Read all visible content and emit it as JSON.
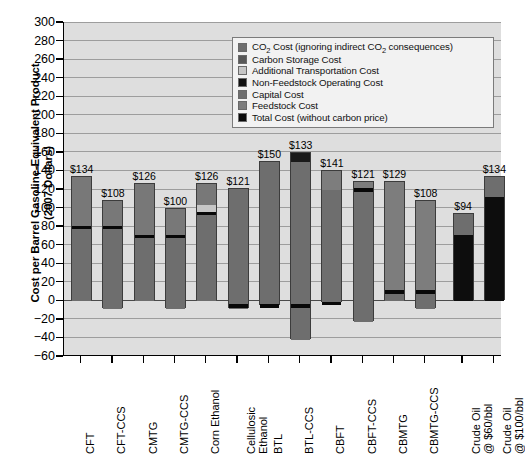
{
  "chart_data": {
    "type": "bar",
    "title": "",
    "xlabel": "",
    "ylabel": "Cost per Barrel Gasoline-Equivalent Product (2007 Dollars)",
    "ylabel_line1": "Cost per Barrel Gasoline-Equivalent Product",
    "ylabel_line2": "(2007 Dollars)",
    "ylim": [
      -60,
      300
    ],
    "ytick_step": 20,
    "ytick_labels": [
      "300",
      "280",
      "260",
      "240",
      "220",
      "200",
      "180",
      "160",
      "140",
      "120",
      "100",
      "80",
      "60",
      "40",
      "20",
      "0",
      "−20",
      "−40",
      "−60"
    ],
    "grid": true,
    "legend_position": "top-right",
    "stacked": true,
    "categories": [
      "CFT",
      "CFT-CCS",
      "CMTG",
      "CMTG-CCS",
      "Corn Ethanol",
      "Cellulosic Ethanol",
      "BTL",
      "BTL-CCS",
      "CBFT",
      "CBFT-CCS",
      "CBMTG",
      "CBMTG-CCS",
      "Crude Oil @ $60/bbl",
      "Crude Oil @ $100/bbl"
    ],
    "category_lines": [
      [
        "CFT"
      ],
      [
        "CFT-CCS"
      ],
      [
        "CMTG"
      ],
      [
        "CMTG-CCS"
      ],
      [
        "Corn Ethanol"
      ],
      [
        "Cellulosic",
        "Ethanol"
      ],
      [
        "BTL"
      ],
      [
        "BTL-CCS"
      ],
      [
        "CBFT"
      ],
      [
        "CBFT-CCS"
      ],
      [
        "CBMTG"
      ],
      [
        "CBMTG-CCS"
      ],
      [
        "Crude Oil",
        "@ $60/bbl"
      ],
      [
        "Crude Oil",
        "@ $100/bbl"
      ]
    ],
    "top_labels": [
      "$134",
      "$108",
      "$126",
      "$100",
      "$126",
      "$121",
      "$150",
      "$133",
      "$141",
      "$121",
      "$129",
      "$108",
      "$94",
      "$134"
    ],
    "values": [
      134,
      108,
      126,
      100,
      126,
      121,
      150,
      133,
      141,
      121,
      129,
      108,
      94,
      134
    ],
    "series": [
      {
        "name": "Feedstock Cost",
        "color": "#6e6e6e",
        "values": [
          134,
          108,
          126,
          100,
          126,
          121,
          150,
          133,
          141,
          121,
          129,
          108,
          0,
          0
        ]
      },
      {
        "name": "Capital Cost",
        "color": "#6e6e6e",
        "values": [
          0,
          0,
          0,
          0,
          0,
          0,
          0,
          0,
          0,
          0,
          0,
          0,
          0,
          0
        ]
      },
      {
        "name": "Non-Feedstock Operating Cost",
        "color": "#0d0d0d",
        "values": [
          0,
          0,
          0,
          0,
          0,
          0,
          0,
          0,
          0,
          0,
          0,
          0,
          94,
          134
        ]
      },
      {
        "name": "Additional Transportation Cost",
        "color": "#c6c6c6",
        "values": [
          0,
          0,
          0,
          0,
          8,
          0,
          0,
          0,
          0,
          0,
          0,
          0,
          0,
          0
        ]
      },
      {
        "name": "Carbon Storage Cost",
        "color": "#585858",
        "values": [
          0,
          0,
          0,
          0,
          0,
          0,
          0,
          0,
          0,
          0,
          0,
          0,
          0,
          0
        ]
      },
      {
        "name": "CO2 Cost (ignoring indirect CO2 consequences)",
        "color": "#6e6e6e",
        "values": [
          0,
          0,
          0,
          0,
          0,
          0,
          0,
          0,
          0,
          0,
          0,
          0,
          22,
          22
        ]
      }
    ],
    "total_cost_markers": [
      80,
      80,
      70,
      70,
      95,
      -5,
      -5,
      -5,
      -2,
      120,
      10,
      10,
      null,
      null
    ],
    "bars": [
      {
        "category": "CFT",
        "label": "$134",
        "top": 134,
        "bottom": 0,
        "total_cost_line": 80,
        "segments": [
          {
            "from": 0,
            "to": 80,
            "color": "#6e6e6e"
          },
          {
            "from": 80,
            "to": 134,
            "color": "#787878"
          }
        ]
      },
      {
        "category": "CFT-CCS",
        "label": "$108",
        "top": 108,
        "bottom": -8,
        "total_cost_line": 80,
        "segments": [
          {
            "from": -8,
            "to": 80,
            "color": "#6e6e6e"
          },
          {
            "from": 80,
            "to": 108,
            "color": "#787878"
          }
        ]
      },
      {
        "category": "CMTG",
        "label": "$126",
        "top": 126,
        "bottom": 0,
        "total_cost_line": 70,
        "segments": [
          {
            "from": 0,
            "to": 70,
            "color": "#6e6e6e"
          },
          {
            "from": 70,
            "to": 126,
            "color": "#787878"
          }
        ]
      },
      {
        "category": "CMTG-CCS",
        "label": "$100",
        "top": 100,
        "bottom": -8,
        "total_cost_line": 70,
        "segments": [
          {
            "from": -8,
            "to": 70,
            "color": "#6e6e6e"
          },
          {
            "from": 70,
            "to": 100,
            "color": "#787878"
          }
        ]
      },
      {
        "category": "Corn Ethanol",
        "label": "$126",
        "top": 126,
        "bottom": 0,
        "total_cost_line": 95,
        "segments": [
          {
            "from": 0,
            "to": 95,
            "color": "#6e6e6e"
          },
          {
            "from": 95,
            "to": 104,
            "color": "#c6c6c6"
          },
          {
            "from": 104,
            "to": 126,
            "color": "#787878"
          }
        ]
      },
      {
        "category": "Cellulosic Ethanol",
        "label": "$121",
        "top": 121,
        "bottom": -8,
        "total_cost_line": -5,
        "segments": [
          {
            "from": -8,
            "to": 121,
            "color": "#6e6e6e"
          }
        ]
      },
      {
        "category": "BTL",
        "label": "$150",
        "top": 150,
        "bottom": -5,
        "total_cost_line": -5,
        "segments": [
          {
            "from": -5,
            "to": 150,
            "color": "#6e6e6e"
          }
        ]
      },
      {
        "category": "BTL-CCS",
        "label": "$133",
        "top": 160,
        "bottom": -42,
        "total_cost_line": -5,
        "segments": [
          {
            "from": -42,
            "to": 150,
            "color": "#6e6e6e"
          },
          {
            "from": 150,
            "to": 160,
            "color": "#1a1a1a"
          }
        ]
      },
      {
        "category": "CBFT",
        "label": "$141",
        "top": 141,
        "bottom": -2,
        "total_cost_line": -2,
        "segments": [
          {
            "from": -2,
            "to": 120,
            "color": "#6e6e6e"
          },
          {
            "from": 120,
            "to": 141,
            "color": "#7d7d7d"
          }
        ]
      },
      {
        "category": "CBFT-CCS",
        "label": "$121",
        "top": 129,
        "bottom": -22,
        "total_cost_line": 120,
        "segments": [
          {
            "from": -22,
            "to": 120,
            "color": "#6e6e6e"
          },
          {
            "from": 120,
            "to": 129,
            "color": "#7d7d7d"
          }
        ]
      },
      {
        "category": "CBMTG",
        "label": "$129",
        "top": 129,
        "bottom": 0,
        "total_cost_line": 10,
        "segments": [
          {
            "from": 0,
            "to": 10,
            "color": "#6e6e6e"
          },
          {
            "from": 10,
            "to": 129,
            "color": "#7d7d7d"
          }
        ]
      },
      {
        "category": "CBMTG-CCS",
        "label": "$108",
        "top": 108,
        "bottom": -8,
        "total_cost_line": 10,
        "segments": [
          {
            "from": -8,
            "to": 10,
            "color": "#6e6e6e"
          },
          {
            "from": 10,
            "to": 108,
            "color": "#7d7d7d"
          }
        ]
      },
      {
        "category": "Crude Oil @ $60/bbl",
        "label": "$94",
        "top": 94,
        "bottom": 0,
        "total_cost_line": null,
        "segments": [
          {
            "from": 0,
            "to": 72,
            "color": "#0d0d0d"
          },
          {
            "from": 72,
            "to": 94,
            "color": "#6e6e6e"
          }
        ]
      },
      {
        "category": "Crude Oil @ $100/bbl",
        "label": "$134",
        "top": 134,
        "bottom": 0,
        "total_cost_line": null,
        "segments": [
          {
            "from": 0,
            "to": 112,
            "color": "#0d0d0d"
          },
          {
            "from": 112,
            "to": 134,
            "color": "#6e6e6e"
          }
        ]
      }
    ]
  },
  "legend": {
    "items": [
      {
        "label_html": "CO<sub>2</sub> Cost (ignoring indirect CO<sub>2</sub> consequences)",
        "label": "CO2 Cost (ignoring indirect CO2 consequences)",
        "color": "#6e6e6e"
      },
      {
        "label_html": "Carbon Storage Cost",
        "label": "Carbon Storage Cost",
        "color": "#585858"
      },
      {
        "label_html": "Additional Transportation Cost",
        "label": "Additional Transportation Cost",
        "color": "#c6c6c6"
      },
      {
        "label_html": "Non-Feedstock Operating Cost",
        "label": "Non-Feedstock Operating Cost",
        "color": "#111111"
      },
      {
        "label_html": "Capital Cost",
        "label": "Capital Cost",
        "color": "#6e6e6e"
      },
      {
        "label_html": "Feedstock Cost",
        "label": "Feedstock Cost",
        "color": "#7d7d7d"
      },
      {
        "label_html": "Total Cost (without carbon price)",
        "label": "Total Cost (without carbon price)",
        "color": "#0a0a0a"
      }
    ]
  }
}
